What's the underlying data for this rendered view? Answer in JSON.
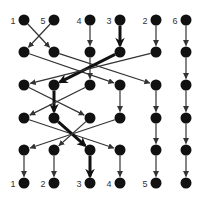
{
  "diagram": {
    "type": "sorting-network",
    "columns_x": [
      24,
      54,
      90,
      120,
      156,
      186
    ],
    "rows_y": [
      20,
      52,
      85,
      118,
      150,
      183
    ],
    "node_radius": 5.5,
    "node_color": "#111111",
    "edge_color": "#333333",
    "highlight_color": "#111111",
    "top_labels": [
      "1",
      "5",
      "4",
      "3",
      "2",
      "6"
    ],
    "bottom_labels": [
      "1",
      "2",
      "3",
      "4",
      "5",
      ""
    ],
    "edges": [
      {
        "from": [
          0,
          0
        ],
        "to": [
          1,
          1
        ],
        "bold": false
      },
      {
        "from": [
          0,
          1
        ],
        "to": [
          1,
          0
        ],
        "bold": false
      },
      {
        "from": [
          0,
          2
        ],
        "to": [
          1,
          2
        ],
        "bold": false
      },
      {
        "from": [
          0,
          3
        ],
        "to": [
          1,
          3
        ],
        "bold": true
      },
      {
        "from": [
          0,
          4
        ],
        "to": [
          1,
          4
        ],
        "bold": false
      },
      {
        "from": [
          0,
          5
        ],
        "to": [
          1,
          5
        ],
        "bold": false
      },
      {
        "from": [
          1,
          0
        ],
        "to": [
          2,
          3
        ],
        "bold": false
      },
      {
        "from": [
          1,
          1
        ],
        "to": [
          2,
          4
        ],
        "bold": false
      },
      {
        "from": [
          1,
          2
        ],
        "to": [
          2,
          2
        ],
        "bold": false
      },
      {
        "from": [
          1,
          3
        ],
        "to": [
          2,
          1
        ],
        "bold": true
      },
      {
        "from": [
          1,
          4
        ],
        "to": [
          2,
          0
        ],
        "bold": false
      },
      {
        "from": [
          1,
          5
        ],
        "to": [
          2,
          5
        ],
        "bold": false
      },
      {
        "from": [
          2,
          0
        ],
        "to": [
          3,
          2
        ],
        "bold": false
      },
      {
        "from": [
          2,
          1
        ],
        "to": [
          3,
          1
        ],
        "bold": true
      },
      {
        "from": [
          2,
          2
        ],
        "to": [
          3,
          0
        ],
        "bold": false
      },
      {
        "from": [
          2,
          3
        ],
        "to": [
          3,
          3
        ],
        "bold": false
      },
      {
        "from": [
          2,
          4
        ],
        "to": [
          3,
          4
        ],
        "bold": false
      },
      {
        "from": [
          2,
          5
        ],
        "to": [
          3,
          5
        ],
        "bold": false
      },
      {
        "from": [
          3,
          0
        ],
        "to": [
          4,
          3
        ],
        "bold": false
      },
      {
        "from": [
          3,
          1
        ],
        "to": [
          4,
          2
        ],
        "bold": true
      },
      {
        "from": [
          3,
          2
        ],
        "to": [
          4,
          1
        ],
        "bold": false
      },
      {
        "from": [
          3,
          3
        ],
        "to": [
          4,
          0
        ],
        "bold": false
      },
      {
        "from": [
          3,
          4
        ],
        "to": [
          4,
          4
        ],
        "bold": false
      },
      {
        "from": [
          3,
          5
        ],
        "to": [
          4,
          5
        ],
        "bold": false
      },
      {
        "from": [
          4,
          0
        ],
        "to": [
          5,
          0
        ],
        "bold": false
      },
      {
        "from": [
          4,
          1
        ],
        "to": [
          5,
          1
        ],
        "bold": false
      },
      {
        "from": [
          4,
          2
        ],
        "to": [
          5,
          2
        ],
        "bold": true
      },
      {
        "from": [
          4,
          3
        ],
        "to": [
          5,
          3
        ],
        "bold": false
      },
      {
        "from": [
          4,
          4
        ],
        "to": [
          5,
          4
        ],
        "bold": false
      },
      {
        "from": [
          4,
          5
        ],
        "to": [
          5,
          5
        ],
        "bold": false
      }
    ]
  }
}
